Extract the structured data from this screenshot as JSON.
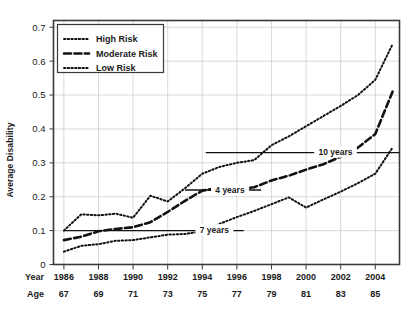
{
  "chart_data": {
    "type": "line",
    "title": "",
    "xlabel": "",
    "ylabel": "Average Disability",
    "ylim": [
      0,
      0.72
    ],
    "xlim": [
      1985.4,
      2005.4
    ],
    "grid": true,
    "legend_position": "top-left",
    "y_ticks": [
      "0",
      "0.1",
      "0.2",
      "0.3",
      "0.4",
      "0.5",
      "0.6",
      "0.7"
    ],
    "y_tick_values": [
      0,
      0.1,
      0.2,
      0.3,
      0.4,
      0.5,
      0.6,
      0.7
    ],
    "x_axis_rows": [
      {
        "header": "Year",
        "labels": [
          "1986",
          "1988",
          "1990",
          "1992",
          "1994",
          "1996",
          "1998",
          "2000",
          "2002",
          "2004"
        ]
      },
      {
        "header": "Age",
        "labels": [
          "67",
          "69",
          "71",
          "73",
          "75",
          "77",
          "79",
          "81",
          "83",
          "85"
        ]
      }
    ],
    "x_tick_values": [
      1986,
      1988,
      1990,
      1992,
      1994,
      1996,
      1998,
      2000,
      2002,
      2004
    ],
    "x": [
      1986,
      1987,
      1988,
      1989,
      1990,
      1991,
      1992,
      1993,
      1994,
      1995,
      1996,
      1997,
      1998,
      1999,
      2000,
      2001,
      2002,
      2003,
      2004,
      2005
    ],
    "series": [
      {
        "name": "High Risk",
        "style": "dotted",
        "values": [
          0.1,
          0.148,
          0.145,
          0.15,
          0.138,
          0.203,
          0.186,
          0.225,
          0.268,
          0.288,
          0.3,
          0.308,
          0.352,
          0.378,
          0.408,
          0.438,
          0.468,
          0.5,
          0.545,
          0.65
        ]
      },
      {
        "name": "Moderate Risk",
        "style": "dashed",
        "values": [
          0.072,
          0.082,
          0.098,
          0.105,
          0.11,
          0.125,
          0.155,
          0.188,
          0.218,
          0.226,
          0.222,
          0.228,
          0.248,
          0.262,
          0.28,
          0.296,
          0.318,
          0.345,
          0.385,
          0.51
        ]
      },
      {
        "name": "Low Risk",
        "style": "dotted",
        "values": [
          0.038,
          0.055,
          0.06,
          0.07,
          0.072,
          0.08,
          0.088,
          0.09,
          0.098,
          0.12,
          0.14,
          0.158,
          0.178,
          0.198,
          0.168,
          0.192,
          0.215,
          0.24,
          0.268,
          0.345
        ]
      }
    ],
    "annotations": [
      {
        "label": "7 years",
        "y": 0.1,
        "x_start": 1986.0,
        "x_end": 1996.4,
        "text_x": 1994.7
      },
      {
        "label": "4 years",
        "y": 0.22,
        "x_start": 1993.0,
        "x_end": 1997.4,
        "text_x": 1995.6
      },
      {
        "label": "10 years",
        "y": 0.33,
        "x_start": 1994.2,
        "x_end": 2005.4,
        "text_x": 2001.7
      }
    ]
  }
}
